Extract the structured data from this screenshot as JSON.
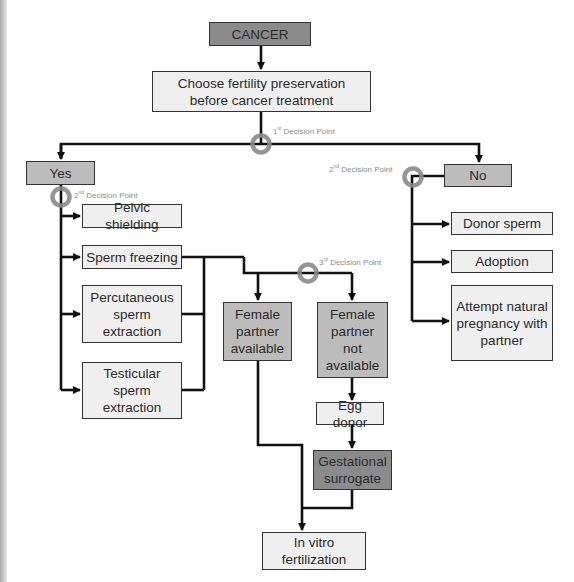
{
  "diagram": {
    "type": "flowchart",
    "nodes": {
      "cancer": "CANCER",
      "choose": "Choose fertility preservation before cancer treatment",
      "yes": "Yes",
      "no": "No",
      "pelvic": "Pelvic shielding",
      "sperm_freezing": "Sperm freezing",
      "percutaneous": "Percutaneous sperm extraction",
      "testicular": "Testicular sperm extraction",
      "female_available": "Female partner available",
      "female_not_available": "Female partner not available",
      "egg_donor": "Egg donor",
      "gestational": "Gestational surrogate",
      "ivf": "In vitro fertilization",
      "donor_sperm": "Donor sperm",
      "adoption": "Adoption",
      "natural": "Attempt natural pregnancy with partner"
    },
    "decision_points": {
      "dp1": {
        "ordinal": "1",
        "suffix": "st",
        "text": "Decision Point"
      },
      "dp2a": {
        "ordinal": "2",
        "suffix": "nd",
        "text": "Decision Point"
      },
      "dp2b": {
        "ordinal": "2",
        "suffix": "nd",
        "text": "Decision Point"
      },
      "dp3": {
        "ordinal": "3",
        "suffix": "rd",
        "text": "Decision Point"
      }
    },
    "colors": {
      "line": "#111111",
      "decision_ring": "#8a8a8a",
      "box_light": "#efefef",
      "box_mid": "#bcbcbc",
      "box_dark": "#8b8b8b"
    }
  }
}
